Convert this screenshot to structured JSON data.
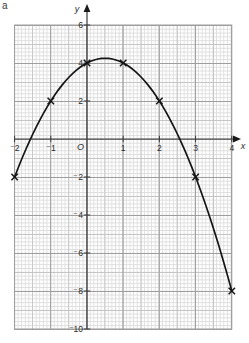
{
  "part_label": "a",
  "axes": {
    "x_label": "x",
    "y_label": "y",
    "origin_label": "O",
    "x_ticks": [
      {
        "value": -2,
        "label": "⁻2"
      },
      {
        "value": -1,
        "label": "⁻1"
      },
      {
        "value": 1,
        "label": "1"
      },
      {
        "value": 2,
        "label": "2"
      },
      {
        "value": 3,
        "label": "3"
      },
      {
        "value": 4,
        "label": "4"
      }
    ],
    "y_ticks": [
      {
        "value": 6,
        "label": "6"
      },
      {
        "value": 4,
        "label": "4"
      },
      {
        "value": 2,
        "label": "2"
      },
      {
        "value": -2,
        "label": "⁻2"
      },
      {
        "value": -4,
        "label": "⁻4"
      },
      {
        "value": -6,
        "label": "⁻6"
      },
      {
        "value": -8,
        "label": "⁻8"
      },
      {
        "value": -10,
        "label": "⁻10"
      }
    ]
  },
  "chart_data": {
    "type": "line",
    "title": "",
    "xlabel": "x",
    "ylabel": "y",
    "xlim": [
      -2,
      4
    ],
    "ylim": [
      -10,
      6
    ],
    "x_major_step": 1,
    "y_major_step": 2,
    "grid": "fine graph paper with medium and major rulings",
    "curve": {
      "kind": "quadratic",
      "equation": "y = 4 + x - x^2",
      "coefficients": {
        "a": -1,
        "b": 1,
        "c": 4
      },
      "x_domain": [
        -2,
        4
      ],
      "vertex": [
        0.5,
        4.25
      ]
    },
    "points": [
      {
        "x": -2,
        "y": -2
      },
      {
        "x": -1,
        "y": 2
      },
      {
        "x": 0,
        "y": 4
      },
      {
        "x": 1,
        "y": 4
      },
      {
        "x": 2,
        "y": 2
      },
      {
        "x": 3,
        "y": -2
      },
      {
        "x": 4,
        "y": -8
      }
    ],
    "marker": "x-cross",
    "colors": {
      "curve": "#151515",
      "axis": "#3a3a3a",
      "grid_major": "#9e9e9e",
      "grid_medium": "#c6c6c6",
      "grid_fine": "#dedede",
      "text": "#2b2b2b"
    }
  }
}
